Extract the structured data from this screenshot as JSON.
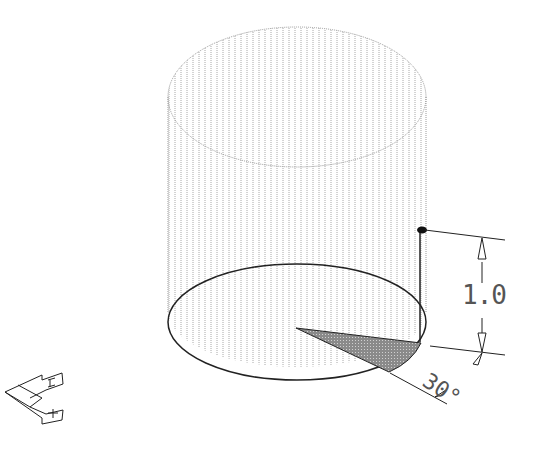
{
  "diagram": {
    "dimensions": {
      "height_label": "1.0",
      "angle_label": "30°"
    },
    "colors": {
      "line": "#222222",
      "hatch": "#9a9a9a",
      "wedge_fill": "#777777"
    },
    "icons": {
      "ucs": "ucs-axis-icon"
    }
  }
}
